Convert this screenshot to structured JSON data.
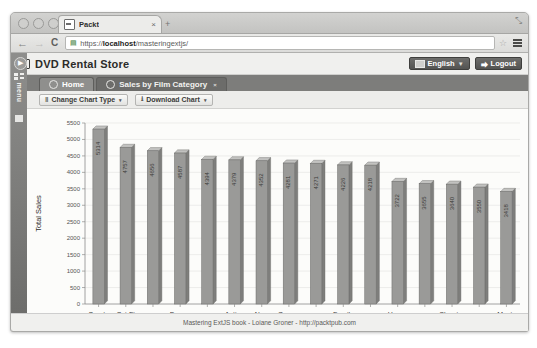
{
  "browser": {
    "tab_title": "Packt",
    "tab_close": "×",
    "new_tab": "+",
    "url_prefix": "https://",
    "url_host": "localhost",
    "url_path": "/masteringextjs/",
    "lock_icon": "▤",
    "back_icon": "←",
    "forward_icon": "→",
    "reload_icon": "C",
    "star_icon": "☆",
    "expand_icon": "⤡"
  },
  "app": {
    "title": "DVD Rental Store",
    "language_label": "English",
    "language_caret": "▼",
    "logout_label": "Logout",
    "logout_icon": "⮕",
    "rail": {
      "expand_icon": "▶",
      "menu_label": "menu"
    },
    "tabs": [
      {
        "label": "Home",
        "active": true,
        "closable": false
      },
      {
        "label": "Sales by Film Category",
        "active": false,
        "closable": true
      }
    ],
    "toolbar": [
      {
        "label": "Change Chart Type",
        "icon": "‖",
        "caret": "▾"
      },
      {
        "label": "Download Chart",
        "icon": "⭳",
        "caret": "▾"
      }
    ],
    "footer_text": "Mastering ExtJS book - Loiane Groner - http://packtpub.com"
  },
  "chart_data": {
    "type": "bar",
    "title": "",
    "xlabel": "Film Category",
    "ylabel": "Total Sales",
    "ylim": [
      0,
      5500
    ],
    "yticks": [
      0,
      500,
      1000,
      1500,
      2000,
      2500,
      3000,
      3500,
      4000,
      4500,
      5000,
      5500
    ],
    "grid": true,
    "legend": "none",
    "bar_color": "#9a9a98",
    "categories": [
      "Sports",
      "Sci-Fi",
      "Animation",
      "Drama",
      "Comedy",
      "Action",
      "New",
      "Games",
      "Foreign",
      "Family",
      "Documentary",
      "Horror",
      "Children",
      "Classics",
      "Travel",
      "Music"
    ],
    "tick_labels_shown": [
      "Sports",
      "Sci-Fi",
      "",
      "Drama",
      "",
      "Action",
      "New",
      "Games",
      "",
      "Family",
      "",
      "Horror",
      "",
      "Classics",
      "",
      "Music"
    ],
    "values": [
      5314,
      4757,
      4656,
      4587,
      4394,
      4379,
      4352,
      4281,
      4271,
      4226,
      4218,
      3722,
      3655,
      3640,
      3550,
      3418
    ]
  }
}
